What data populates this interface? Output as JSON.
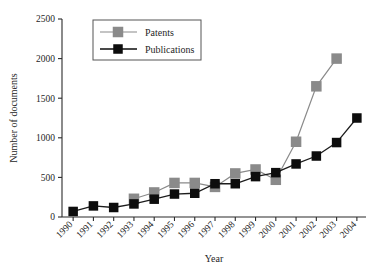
{
  "chart_data": {
    "type": "line",
    "title": "",
    "xlabel": "Year",
    "ylabel": "Number of documents",
    "categories": [
      "1990",
      "1991",
      "1992",
      "1993",
      "1994",
      "1995",
      "1996",
      "1997",
      "1998",
      "1999",
      "2000",
      "2001",
      "2002",
      "2003",
      "2004"
    ],
    "ylim": [
      0,
      2500
    ],
    "yticks": [
      0,
      500,
      1000,
      1500,
      2000,
      2500
    ],
    "grid": false,
    "legend_position": "top-left",
    "series": [
      {
        "name": "Patents",
        "color": "#8a8a8a",
        "marker": "square",
        "values": [
          null,
          null,
          null,
          230,
          310,
          430,
          430,
          380,
          550,
          600,
          470,
          950,
          1650,
          2000,
          null
        ]
      },
      {
        "name": "Publications",
        "color": "#0d0d0d",
        "marker": "square",
        "values": [
          70,
          140,
          120,
          165,
          225,
          290,
          300,
          420,
          420,
          510,
          560,
          670,
          770,
          940,
          1250
        ]
      }
    ]
  },
  "legend": {
    "entries": [
      {
        "label": "Patents"
      },
      {
        "label": "Publications"
      }
    ]
  },
  "axes": {
    "y_tick_labels": [
      "0",
      "500",
      "1000",
      "1500",
      "2000",
      "2500"
    ],
    "x_tick_labels": [
      "1990",
      "1991",
      "1992",
      "1993",
      "1994",
      "1995",
      "1996",
      "1997",
      "1998",
      "1999",
      "2000",
      "2001",
      "2002",
      "2003",
      "2004"
    ],
    "y_axis_title": "Number of documents",
    "x_axis_title": "Year"
  }
}
